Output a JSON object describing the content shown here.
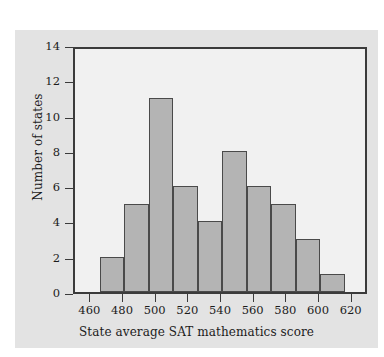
{
  "chart_data": {
    "type": "bar",
    "title": "",
    "xlabel": "State average SAT mathematics score",
    "ylabel": "Number of states",
    "xlim": [
      450,
      630
    ],
    "ylim": [
      0,
      14
    ],
    "xticks": [
      460,
      480,
      500,
      520,
      540,
      560,
      580,
      600,
      620
    ],
    "yticks": [
      0,
      2,
      4,
      6,
      8,
      10,
      12,
      14
    ],
    "grid": false,
    "legend": null,
    "bin_width": 15,
    "bin_edges": [
      465,
      480,
      495,
      510,
      525,
      540,
      555,
      570,
      585,
      600,
      615
    ],
    "categories": [
      "465-480",
      "480-495",
      "495-510",
      "510-525",
      "525-540",
      "540-555",
      "555-570",
      "570-585",
      "585-600",
      "600-615"
    ],
    "values": [
      2,
      5,
      11,
      6,
      4,
      8,
      6,
      5,
      3,
      1
    ],
    "bar_color": "#b4b4b4",
    "bar_edge_color": "#4a4a4a",
    "plot_background": "#f1f1f1",
    "figure_background": "#e3e3e3",
    "axis_color": "#3b3b3b"
  }
}
